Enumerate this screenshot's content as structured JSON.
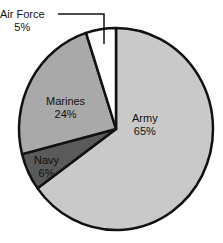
{
  "chart_data": {
    "type": "pie",
    "title": "",
    "categories": [
      "Army",
      "Navy",
      "Marines",
      "Air Force"
    ],
    "values": [
      65,
      6,
      24,
      5
    ],
    "unit": "%",
    "colors": [
      "#c9c9c9",
      "#5a5a5a",
      "#a9a9a9",
      "#ffffff"
    ],
    "start_angle": "12 o'clock",
    "direction": "clockwise",
    "labels": [
      {
        "name": "Army",
        "value": "65%"
      },
      {
        "name": "Navy",
        "value": "6%"
      },
      {
        "name": "Marines",
        "value": "24%"
      },
      {
        "name": "Air Force",
        "value": "5%"
      }
    ],
    "annotations": [
      "Air Force label connected to slice via leader line"
    ]
  }
}
